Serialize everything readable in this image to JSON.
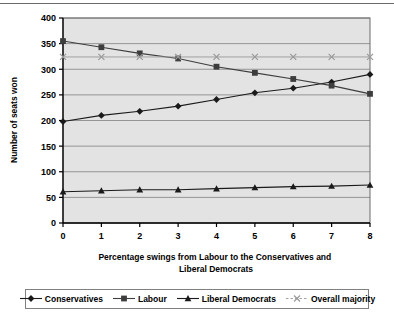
{
  "chart_data": {
    "type": "line",
    "title": "",
    "xlabel": "Percentage swings from Labour to the Conservatives and Liberal Democrats",
    "ylabel": "Number of seats won",
    "x": [
      0,
      1,
      2,
      3,
      4,
      5,
      6,
      7,
      8
    ],
    "categories": [
      "0",
      "1",
      "2",
      "3",
      "4",
      "5",
      "6",
      "7",
      "8"
    ],
    "xlim": [
      0,
      8
    ],
    "ylim": [
      0,
      400
    ],
    "yticks": [
      0,
      50,
      100,
      150,
      200,
      250,
      300,
      350,
      400
    ],
    "ytick_labels": [
      "0",
      "50",
      "100",
      "150",
      "200",
      "250",
      "300",
      "350",
      "400"
    ],
    "grid": "horizontal",
    "legend_position": "bottom",
    "plot_background": "#e3e3e3",
    "series": [
      {
        "name": "Conservatives",
        "marker": "diamond",
        "color": "#1a1a1a",
        "values": [
          198,
          210,
          218,
          228,
          241,
          254,
          263,
          275,
          290
        ]
      },
      {
        "name": "Labour",
        "marker": "square",
        "color": "#3d3d3d",
        "values": [
          355,
          343,
          331,
          321,
          305,
          293,
          281,
          268,
          252
        ]
      },
      {
        "name": "Liberal Democrats",
        "marker": "triangle",
        "color": "#1a1a1a",
        "values": [
          61,
          63,
          65,
          65,
          67,
          69,
          71,
          72,
          74
        ]
      },
      {
        "name": "Overall majority",
        "marker": "cross",
        "color": "#9a9a9a",
        "values": [
          324,
          324,
          324,
          324,
          324,
          324,
          324,
          324,
          324
        ]
      }
    ]
  },
  "axis": {
    "xlabel_line1": "Percentage swings from Labour to the Conservatives and",
    "xlabel_line2": "Liberal Democrats",
    "ylabel": "Number of seats won"
  },
  "legend": {
    "items": [
      {
        "label": "Conservatives",
        "marker": "diamond",
        "color": "#1a1a1a"
      },
      {
        "label": "Labour",
        "marker": "square",
        "color": "#3d3d3d"
      },
      {
        "label": "Liberal Democrats",
        "marker": "triangle",
        "color": "#1a1a1a"
      },
      {
        "label": "Overall majority",
        "marker": "cross",
        "color": "#9a9a9a"
      }
    ]
  }
}
